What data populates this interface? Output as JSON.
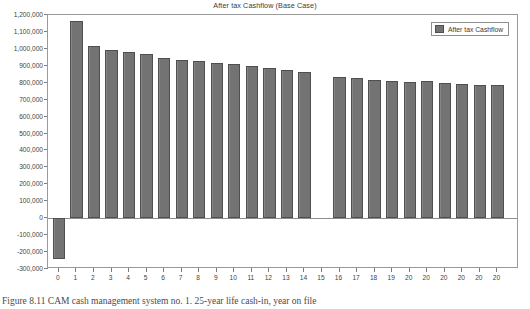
{
  "figure": {
    "caption": "Figure 8.11  CAM cash management system no. 1. 25-year life cash-in, year on file"
  },
  "legend": {
    "position": "top-right",
    "entries": [
      {
        "label": "After tax Cashflow",
        "color": "#737373"
      }
    ]
  },
  "axes": {
    "y_tick_labels": [
      "1,200,000",
      "1,100,000",
      "1,000,000",
      "900,000",
      "800,000",
      "700,000",
      "600,000",
      "500,000",
      "400,000",
      "300,000",
      "200,000",
      "100,000",
      "0",
      "-100,000",
      "-200,000",
      "-300,000"
    ],
    "y_tick_values": [
      1200000,
      1100000,
      1000000,
      900000,
      800000,
      700000,
      600000,
      500000,
      400000,
      300000,
      200000,
      100000,
      0,
      -100000,
      -200000,
      -300000
    ],
    "x_tick_labels": [
      "0",
      "1",
      "2",
      "3",
      "4",
      "5",
      "6",
      "7",
      "8",
      "9",
      "10",
      "11",
      "12",
      "13",
      "14",
      "15",
      "16",
      "17",
      "18",
      "19",
      "20",
      "20",
      "20",
      "20",
      "20",
      "20"
    ]
  },
  "chart_data": {
    "type": "bar",
    "title": "After tax Cashflow (Base Case)",
    "xlabel": "",
    "ylabel": "",
    "ylim": [
      -300000,
      1200000
    ],
    "ytick_step": 100000,
    "grid": false,
    "legend_position": "upper right",
    "bar_color": "#737373",
    "bar_edge_color": "#4f4f4f",
    "categories": [
      "0",
      "1",
      "2",
      "3",
      "4",
      "5",
      "6",
      "7",
      "8",
      "9",
      "10",
      "11",
      "12",
      "13",
      "14",
      "15",
      "16",
      "17",
      "18",
      "19",
      "20",
      "20",
      "20",
      "20",
      "20",
      "20"
    ],
    "series": [
      {
        "name": "After tax Cashflow",
        "values": [
          -240000,
          1162000,
          1018000,
          995000,
          981000,
          972000,
          945000,
          934000,
          926000,
          917000,
          908000,
          898000,
          888000,
          878000,
          866000,
          null,
          832000,
          826000,
          818000,
          812000,
          806000,
          809000,
          800000,
          794000,
          789000,
          784000
        ]
      }
    ]
  }
}
